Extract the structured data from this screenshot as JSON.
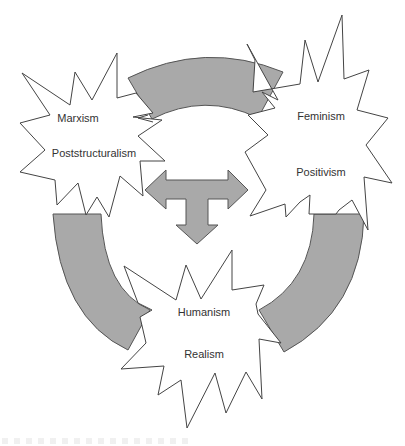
{
  "diagram": {
    "type": "cycle",
    "colors": {
      "arc_fill": "#a9a9a9",
      "arc_stroke": "#555555",
      "star_fill": "#ffffff",
      "star_stroke": "#444444",
      "text": "#333333"
    },
    "nodes": [
      {
        "id": "top-left",
        "labels": [
          "Marxism",
          "Poststructuralism"
        ]
      },
      {
        "id": "right",
        "labels": [
          "Feminism",
          "Positivism"
        ]
      },
      {
        "id": "bottom",
        "labels": [
          "Humanism",
          "Realism"
        ]
      }
    ],
    "connectors": [
      {
        "id": "arc-top",
        "from": "top-left",
        "to": "right"
      },
      {
        "id": "arc-right",
        "from": "right",
        "to": "bottom"
      },
      {
        "id": "arc-left",
        "from": "top-left",
        "to": "bottom"
      }
    ],
    "center_arrow": {
      "shape": "three-way arrow",
      "directions": [
        "left",
        "right",
        "down"
      ]
    }
  }
}
